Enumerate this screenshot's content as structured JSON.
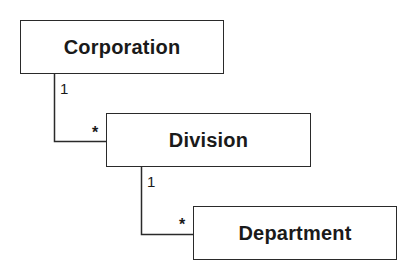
{
  "diagram": {
    "type": "uml-class-hierarchy",
    "classes": [
      {
        "id": "corporation",
        "label": "Corporation"
      },
      {
        "id": "division",
        "label": "Division"
      },
      {
        "id": "department",
        "label": "Department"
      }
    ],
    "associations": [
      {
        "from": "corporation",
        "to": "division",
        "from_multiplicity": "1",
        "to_multiplicity": "*"
      },
      {
        "from": "division",
        "to": "department",
        "from_multiplicity": "1",
        "to_multiplicity": "*"
      }
    ]
  },
  "colors": {
    "line": "#2a2a2a",
    "text": "#1a1a1a",
    "background": "#ffffff"
  }
}
